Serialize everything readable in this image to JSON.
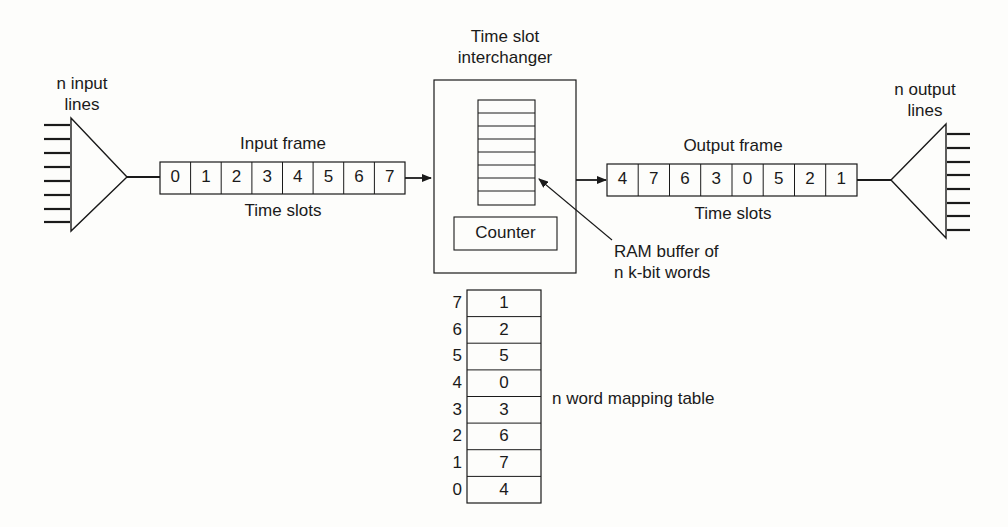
{
  "diagram": {
    "type": "time-slot-interchanger",
    "input": {
      "label_line1": "n input",
      "label_line2": "lines",
      "line_count": 8
    },
    "input_frame": {
      "title": "Input frame",
      "subtitle": "Time slots",
      "slots": [
        "0",
        "1",
        "2",
        "3",
        "4",
        "5",
        "6",
        "7"
      ]
    },
    "tsi": {
      "title_line1": "Time slot",
      "title_line2": "interchanger",
      "ram_rows": 8,
      "counter_label": "Counter",
      "ram_label_line1": "RAM buffer of",
      "ram_label_line2": "n k-bit words"
    },
    "output_frame": {
      "title": "Output frame",
      "subtitle": "Time slots",
      "slots": [
        "4",
        "7",
        "6",
        "3",
        "0",
        "5",
        "2",
        "1"
      ]
    },
    "output": {
      "label_line1": "n output",
      "label_line2": "lines",
      "line_count": 8
    },
    "mapping_table": {
      "label": "n word mapping table",
      "rows": [
        {
          "index": "7",
          "value": "1"
        },
        {
          "index": "6",
          "value": "2"
        },
        {
          "index": "5",
          "value": "5"
        },
        {
          "index": "4",
          "value": "0"
        },
        {
          "index": "3",
          "value": "3"
        },
        {
          "index": "2",
          "value": "6"
        },
        {
          "index": "1",
          "value": "7"
        },
        {
          "index": "0",
          "value": "4"
        }
      ]
    },
    "colors": {
      "stroke": "#1a1a1a",
      "background": "#fdfdfb"
    }
  }
}
